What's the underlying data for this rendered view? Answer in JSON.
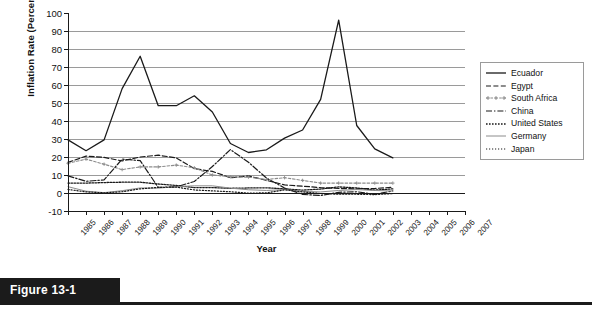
{
  "figure": {
    "caption": "Figure 13-1"
  },
  "chart_data": {
    "type": "line",
    "title": "",
    "xlabel": "Year",
    "ylabel": "Inflation Rate (Percent)",
    "ylim": [
      -10,
      100
    ],
    "ytick_step": 10,
    "yticks": [
      100,
      90,
      80,
      70,
      60,
      50,
      40,
      30,
      20,
      10,
      0,
      -10
    ],
    "grid": true,
    "grid_axis": "y",
    "legend_position": "right",
    "x": [
      1985,
      1986,
      1987,
      1988,
      1989,
      1990,
      1991,
      1992,
      1993,
      1994,
      1995,
      1996,
      1997,
      1998,
      1999,
      2000,
      2001,
      2002,
      2003,
      2004,
      2005,
      2006,
      2007
    ],
    "categories": [
      "1985",
      "1986",
      "1987",
      "1988",
      "1989",
      "1990",
      "1991",
      "1992",
      "1993",
      "1994",
      "1995",
      "1996",
      "1997",
      "1998",
      "1999",
      "2000",
      "2001",
      "2002",
      "2003",
      "2004",
      "2005",
      "2006",
      "2007"
    ],
    "series": [
      {
        "name": "Ecuador",
        "style": "solid",
        "color": "#1a1a1a",
        "x": [
          1985,
          1986,
          1987,
          1988,
          1989,
          1990,
          1991,
          1992,
          1993,
          1994,
          1995,
          1996,
          1997,
          1998,
          1999,
          2000,
          2001,
          2002,
          2003
        ],
        "values": [
          29.5,
          23.5,
          29.5,
          58.0,
          76.0,
          48.5,
          48.5,
          54.0,
          45.0,
          27.5,
          22.5,
          24.0,
          30.5,
          35.0,
          52.0,
          96.0,
          37.5,
          24.5,
          19.5
        ]
      },
      {
        "name": "Egypt",
        "style": "dashed",
        "color": "#1a1a1a",
        "x": [
          1985,
          1986,
          1987,
          1988,
          1989,
          1990,
          1991,
          1992,
          1993,
          1994,
          1995,
          1996,
          1997,
          1998,
          1999,
          2000,
          2001,
          2002,
          2003
        ],
        "values": [
          17.0,
          20.5,
          19.8,
          17.8,
          20.0,
          21.0,
          19.5,
          13.5,
          12.0,
          8.5,
          9.5,
          7.0,
          4.5,
          3.8,
          3.0,
          2.5,
          2.3,
          2.5,
          3.2
        ]
      },
      {
        "name": "South Africa",
        "style": "dotted-marker",
        "color": "#8c8c8c",
        "x": [
          1985,
          1986,
          1987,
          1988,
          1989,
          1990,
          1991,
          1992,
          1993,
          1994,
          1995,
          1996,
          1997,
          1998,
          1999,
          2000,
          2001,
          2002,
          2003
        ],
        "values": [
          16.5,
          18.8,
          16.0,
          13.0,
          14.5,
          14.5,
          15.5,
          14.0,
          10.0,
          9.0,
          8.8,
          7.5,
          8.5,
          7.0,
          5.5,
          5.5,
          5.5,
          5.5,
          5.5
        ]
      },
      {
        "name": "China",
        "style": "dash-dot",
        "color": "#1a1a1a",
        "x": [
          1985,
          1986,
          1987,
          1988,
          1989,
          1990,
          1991,
          1992,
          1993,
          1994,
          1995,
          1996,
          1997,
          1998,
          1999,
          2000,
          2001,
          2002,
          2003
        ],
        "values": [
          9.5,
          6.5,
          7.3,
          18.8,
          18.0,
          3.1,
          3.4,
          6.4,
          14.7,
          24.1,
          17.1,
          8.3,
          2.8,
          -0.8,
          -1.4,
          0.4,
          0.7,
          -0.8,
          1.2
        ]
      },
      {
        "name": "United States",
        "style": "fine-dotted",
        "color": "#1a1a1a",
        "x": [
          1985,
          1986,
          1987,
          1988,
          1989,
          1990,
          1991,
          1992,
          1993,
          1994,
          1995,
          1996,
          1997,
          1998,
          1999,
          2000,
          2001,
          2002,
          2003
        ],
        "values": [
          5.5,
          5.5,
          5.8,
          6.0,
          6.0,
          5.0,
          4.2,
          3.0,
          3.0,
          2.6,
          2.8,
          2.9,
          2.3,
          1.6,
          2.2,
          3.4,
          2.8,
          1.6,
          2.3
        ]
      },
      {
        "name": "Germany",
        "style": "solid-thin",
        "color": "#8c8c8c",
        "x": [
          1985,
          1986,
          1987,
          1988,
          1989,
          1990,
          1991,
          1992,
          1993,
          1994,
          1995,
          1996,
          1997,
          1998,
          1999,
          2000,
          2001,
          2002,
          2003
        ],
        "values": [
          3.5,
          1.0,
          0.2,
          1.3,
          2.8,
          2.7,
          3.5,
          4.0,
          4.0,
          2.7,
          1.8,
          1.4,
          1.9,
          0.9,
          0.6,
          1.4,
          1.9,
          1.4,
          1.1
        ]
      },
      {
        "name": "Japan",
        "style": "dotted",
        "color": "#1a1a1a",
        "x": [
          1985,
          1986,
          1987,
          1988,
          1989,
          1990,
          1991,
          1992,
          1993,
          1994,
          1995,
          1996,
          1997,
          1998,
          1999,
          2000,
          2001,
          2002,
          2003
        ],
        "values": [
          2.0,
          0.6,
          0.1,
          0.7,
          2.3,
          3.1,
          3.3,
          1.7,
          1.2,
          0.7,
          -0.1,
          0.1,
          1.8,
          0.6,
          -0.3,
          -0.7,
          -0.7,
          -0.9,
          -0.3
        ]
      }
    ]
  }
}
